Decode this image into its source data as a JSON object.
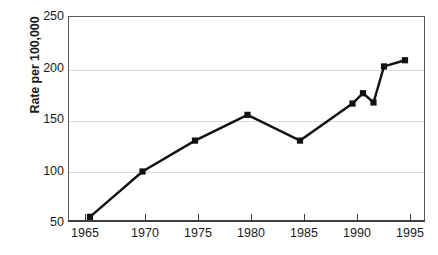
{
  "chart_data": {
    "type": "line",
    "title": "",
    "subtitle": "",
    "xlabel": "",
    "ylabel": "Rate per 100,000",
    "xlim": [
      1963,
      1997
    ],
    "ylim": [
      50,
      250
    ],
    "grid": true,
    "legend": false,
    "x_ticks": [
      "1965",
      "1970",
      "1975",
      "1980",
      "1985",
      "1990",
      "1995"
    ],
    "x_tick_values": [
      1965,
      1970,
      1975,
      1980,
      1985,
      1990,
      1995
    ],
    "y_ticks": [
      "50",
      "100",
      "150",
      "200",
      "250"
    ],
    "y_tick_values": [
      50,
      100,
      150,
      200,
      250
    ],
    "marker": "square",
    "marker_color": "#111111",
    "line_color": "#111111",
    "line_width": 2.4,
    "x": [
      1965,
      1970,
      1975,
      1980,
      1985,
      1990,
      1991,
      1992,
      1993,
      1995
    ],
    "values": [
      56,
      100,
      130,
      155,
      130,
      166,
      176,
      167,
      202,
      208
    ],
    "series": [
      {
        "name": "Rate per 100,000",
        "x": [
          1965,
          1970,
          1975,
          1980,
          1985,
          1990,
          1991,
          1992,
          1993,
          1995
        ],
        "values": [
          56,
          100,
          130,
          155,
          130,
          166,
          176,
          167,
          202,
          208
        ]
      }
    ],
    "annotations": []
  },
  "colors": {
    "line": "#111111",
    "marker": "#111111",
    "grid": "#d9dbdc",
    "axis": "#3a3f42",
    "frame": "#555a5d",
    "text": "#1b1b1b",
    "background": "#ffffff"
  }
}
